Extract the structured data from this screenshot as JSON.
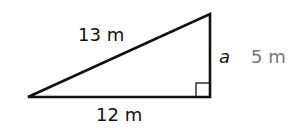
{
  "diagram": {
    "type": "right-triangle",
    "hypotenuse_label": "13 m",
    "base_label": "12 m",
    "side_variable": "a",
    "side_answer": "5 m",
    "colors": {
      "stroke": "#111111",
      "answer": "#777777"
    }
  }
}
